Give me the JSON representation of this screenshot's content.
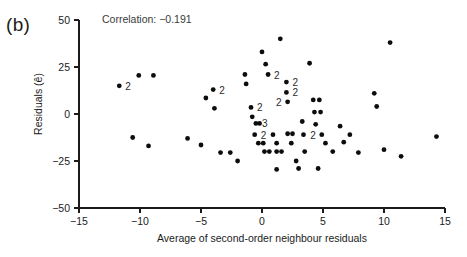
{
  "figure": {
    "panel_label": "(b)",
    "annotation": "Correlation: −0.191"
  },
  "chart_data": {
    "type": "scatter",
    "title": "",
    "xlabel": "Average of second-order neighbour residuals",
    "ylabel": "Residuals (ê)",
    "xlim": [
      -15,
      15
    ],
    "ylim": [
      -50,
      50
    ],
    "xticks": [
      -15,
      -10,
      -5,
      0,
      5,
      10,
      15
    ],
    "xticklabels": [
      "−15",
      "−10",
      "−5",
      "0",
      "5",
      "10",
      "15"
    ],
    "yticks": [
      -50,
      -25,
      0,
      25,
      50
    ],
    "yticklabels": [
      "−50",
      "−25",
      "0",
      "25",
      "50"
    ],
    "grid": false,
    "legend": null,
    "annotations": [
      {
        "text": "Correlation: −0.191",
        "x": -13.0,
        "y": 46.0
      }
    ],
    "points": [
      {
        "x": -11.7,
        "y": 15.0,
        "n": 2,
        "label": "2",
        "label_side": "right"
      },
      {
        "x": -10.1,
        "y": 20.5,
        "n": 1
      },
      {
        "x": -8.9,
        "y": 20.5,
        "n": 1
      },
      {
        "x": -10.6,
        "y": -12.5,
        "n": 1
      },
      {
        "x": -9.3,
        "y": -17.0,
        "n": 1
      },
      {
        "x": -6.1,
        "y": -13.0,
        "n": 1
      },
      {
        "x": -5.0,
        "y": -16.5,
        "n": 1
      },
      {
        "x": -4.6,
        "y": 8.5,
        "n": 1
      },
      {
        "x": -4.0,
        "y": 13.0,
        "n": 2,
        "label": "2",
        "label_side": "right"
      },
      {
        "x": -3.9,
        "y": 3.0,
        "n": 1
      },
      {
        "x": -3.4,
        "y": -20.5,
        "n": 1
      },
      {
        "x": -2.6,
        "y": -20.5,
        "n": 1
      },
      {
        "x": -2.0,
        "y": -25.0,
        "n": 1
      },
      {
        "x": -1.4,
        "y": 21.0,
        "n": 1
      },
      {
        "x": -1.3,
        "y": 16.0,
        "n": 1
      },
      {
        "x": -0.9,
        "y": 3.5,
        "n": 2,
        "label": "2",
        "label_side": "right"
      },
      {
        "x": -0.8,
        "y": -1.5,
        "n": 1
      },
      {
        "x": -0.5,
        "y": -5.0,
        "n": 2,
        "label": "3",
        "label_side": "right"
      },
      {
        "x": -0.2,
        "y": -5.0,
        "n": 1
      },
      {
        "x": -0.6,
        "y": -11.0,
        "n": 2,
        "label": "2",
        "label_side": "right"
      },
      {
        "x": -0.3,
        "y": -15.5,
        "n": 1
      },
      {
        "x": 0.1,
        "y": -15.5,
        "n": 1
      },
      {
        "x": 0.2,
        "y": -20.0,
        "n": 1
      },
      {
        "x": 0.6,
        "y": -20.0,
        "n": 1
      },
      {
        "x": 0.0,
        "y": 33.0,
        "n": 1
      },
      {
        "x": 0.3,
        "y": 26.5,
        "n": 1
      },
      {
        "x": 0.5,
        "y": 21.0,
        "n": 2,
        "label": "2",
        "label_side": "right"
      },
      {
        "x": 0.9,
        "y": -11.0,
        "n": 1
      },
      {
        "x": 1.2,
        "y": -15.5,
        "n": 1
      },
      {
        "x": 1.2,
        "y": -20.0,
        "n": 1
      },
      {
        "x": 1.5,
        "y": 40.0,
        "n": 1
      },
      {
        "x": 1.6,
        "y": -20.0,
        "n": 1
      },
      {
        "x": 2.0,
        "y": 17.0,
        "n": 2,
        "label": "2",
        "label_side": "right"
      },
      {
        "x": 2.0,
        "y": 11.5,
        "n": 2,
        "label": "2",
        "label_side": "right"
      },
      {
        "x": 2.1,
        "y": 6.5,
        "n": 2,
        "label": "2",
        "label_side": "left"
      },
      {
        "x": 2.1,
        "y": -10.5,
        "n": 1
      },
      {
        "x": 2.5,
        "y": -10.5,
        "n": 1
      },
      {
        "x": 2.4,
        "y": -15.5,
        "n": 1
      },
      {
        "x": 2.8,
        "y": -25.0,
        "n": 1
      },
      {
        "x": 3.3,
        "y": -4.0,
        "n": 1
      },
      {
        "x": 3.4,
        "y": -11.0,
        "n": 1
      },
      {
        "x": 3.5,
        "y": -20.0,
        "n": 1
      },
      {
        "x": 3.9,
        "y": 27.0,
        "n": 1
      },
      {
        "x": 4.2,
        "y": 7.5,
        "n": 1
      },
      {
        "x": 4.7,
        "y": 7.5,
        "n": 1
      },
      {
        "x": 4.3,
        "y": 1.0,
        "n": 1
      },
      {
        "x": 4.8,
        "y": 1.0,
        "n": 1
      },
      {
        "x": 4.4,
        "y": -5.5,
        "n": 1
      },
      {
        "x": 4.9,
        "y": -11.0,
        "n": 2,
        "label": "2",
        "label_side": "left"
      },
      {
        "x": 5.2,
        "y": -15.5,
        "n": 1
      },
      {
        "x": 3.0,
        "y": -29.0,
        "n": 1
      },
      {
        "x": 4.6,
        "y": -29.0,
        "n": 1
      },
      {
        "x": 1.2,
        "y": -29.5,
        "n": 1
      },
      {
        "x": 5.8,
        "y": -20.0,
        "n": 1
      },
      {
        "x": 6.4,
        "y": -6.5,
        "n": 1
      },
      {
        "x": 6.7,
        "y": -15.0,
        "n": 1
      },
      {
        "x": 7.2,
        "y": -11.0,
        "n": 1
      },
      {
        "x": 7.9,
        "y": -20.5,
        "n": 1
      },
      {
        "x": 9.2,
        "y": 11.0,
        "n": 1
      },
      {
        "x": 9.4,
        "y": 4.0,
        "n": 1
      },
      {
        "x": 10.5,
        "y": 38.0,
        "n": 1
      },
      {
        "x": 10.0,
        "y": -19.0,
        "n": 1
      },
      {
        "x": 11.4,
        "y": -22.5,
        "n": 1
      },
      {
        "x": 14.3,
        "y": -12.0,
        "n": 1
      }
    ]
  }
}
